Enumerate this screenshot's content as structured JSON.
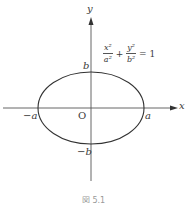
{
  "figure": {
    "axes": {
      "x_label": "x",
      "y_label": "y",
      "origin_label": "O"
    },
    "points": {
      "a_pos": "a",
      "a_neg": "−a",
      "b_pos": "b",
      "b_neg": "−b"
    },
    "equation": {
      "term1_num": "x²",
      "term1_den": "a²",
      "plus": "+",
      "term2_num": "y²",
      "term2_den": "b²",
      "equals": "= 1"
    },
    "ellipse": {
      "center_px": [
        91,
        108
      ],
      "rx_px": 53,
      "ry_px": 36,
      "stroke": "#333333"
    },
    "caption": "図 5.1"
  }
}
